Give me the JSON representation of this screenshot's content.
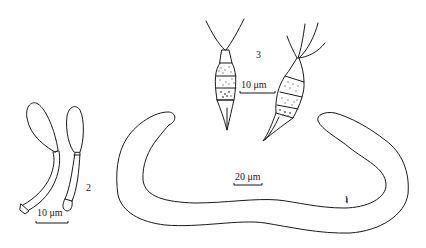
{
  "figure": {
    "ink_color": "#1a1a1a",
    "stipple_color": "#6a6a6a",
    "background": "#ffffff",
    "panels": [
      {
        "id": "1",
        "label": "1",
        "description": "elongated curved U-shaped worm-like organism outline"
      },
      {
        "id": "2",
        "label": "2",
        "description": "two club-shaped cells on stalks"
      },
      {
        "id": "3",
        "label": "3",
        "description": "two spindle-shaped cells with stippled segments and apical appendages"
      }
    ],
    "scale_bars": [
      {
        "panel": "2",
        "label": "10 μm"
      },
      {
        "panel": "3",
        "label": "10 μm"
      },
      {
        "panel": "1",
        "label": "20 μm"
      }
    ]
  }
}
